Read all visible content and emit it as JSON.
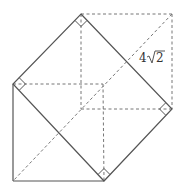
{
  "diagram": {
    "type": "geometry-figure",
    "labels": {
      "side_length": "4√2",
      "side_number": "4",
      "side_radical": "2"
    },
    "colors": {
      "solid": "#555555",
      "dashed": "#777777",
      "text": "#333333"
    }
  }
}
